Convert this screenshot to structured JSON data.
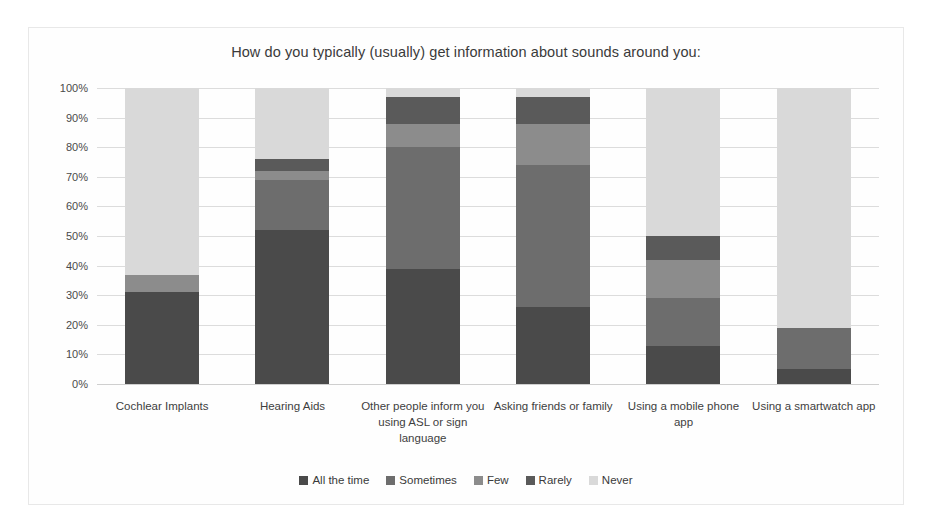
{
  "chart_data": {
    "type": "bar",
    "subtype": "stacked-100-percent",
    "title": "How do you typically (usually) get information about sounds around you:",
    "xlabel": "",
    "ylabel": "",
    "ylim": [
      0,
      100
    ],
    "ytick_labels": [
      "100%",
      "90%",
      "80%",
      "70%",
      "60%",
      "50%",
      "40%",
      "30%",
      "20%",
      "10%",
      "0%"
    ],
    "ytick_values": [
      100,
      90,
      80,
      70,
      60,
      50,
      40,
      30,
      20,
      10,
      0
    ],
    "grid": true,
    "legend_position": "bottom",
    "categories": [
      "Cochlear Implants",
      "Hearing Aids",
      "Other people inform you using ASL or sign language",
      "Asking friends or family",
      "Using a mobile phone app",
      "Using a smartwatch app"
    ],
    "series": [
      {
        "name": "All the time",
        "color": "#4a4a4a",
        "values": [
          31,
          52,
          39,
          26,
          13,
          5
        ]
      },
      {
        "name": "Sometimes",
        "color": "#6d6d6d",
        "values": [
          0,
          17,
          41,
          48,
          16,
          14
        ]
      },
      {
        "name": "Few",
        "color": "#8c8c8c",
        "values": [
          6,
          3,
          8,
          14,
          13,
          0
        ]
      },
      {
        "name": "Rarely",
        "color": "#5a5a5a",
        "values": [
          0,
          4,
          9,
          9,
          8,
          0
        ]
      },
      {
        "name": "Never",
        "color": "#d9d9d9",
        "values": [
          63,
          24,
          3,
          3,
          50,
          81
        ]
      }
    ]
  }
}
